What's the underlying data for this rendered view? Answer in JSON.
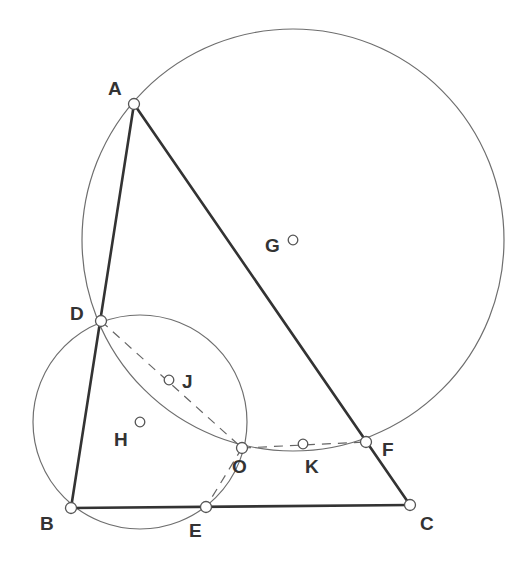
{
  "diagram": {
    "type": "geometry",
    "colors": {
      "background": "#ffffff",
      "triangle": "#333333",
      "circles": "#6e6e6e",
      "dashed": "#666666",
      "labels": "#333333"
    },
    "points": {
      "A": {
        "label": "A",
        "x": 134,
        "y": 104,
        "lx": 108,
        "ly": 95
      },
      "B": {
        "label": "B",
        "x": 71,
        "y": 508,
        "lx": 40,
        "ly": 530
      },
      "C": {
        "label": "C",
        "x": 410,
        "y": 505,
        "lx": 420,
        "ly": 530
      },
      "D": {
        "label": "D",
        "x": 101,
        "y": 321,
        "lx": 70,
        "ly": 320
      },
      "E": {
        "label": "E",
        "x": 206,
        "y": 507,
        "lx": 189,
        "ly": 537
      },
      "F": {
        "label": "F",
        "x": 366,
        "y": 442,
        "lx": 382,
        "ly": 456
      },
      "O": {
        "label": "O",
        "x": 242,
        "y": 448,
        "lx": 232,
        "ly": 473
      },
      "K": {
        "label": "K",
        "x": 303,
        "y": 444,
        "lx": 305,
        "ly": 473
      },
      "J": {
        "label": "J",
        "x": 169,
        "y": 380,
        "lx": 182,
        "ly": 388
      },
      "G": {
        "label": "G",
        "x": 293,
        "y": 240,
        "lx": 265,
        "ly": 252
      },
      "H": {
        "label": "H",
        "x": 140,
        "y": 422,
        "lx": 114,
        "ly": 446
      }
    },
    "circles": [
      {
        "name": "circle-G",
        "center": "G",
        "cx": 293,
        "cy": 240,
        "r": 211
      },
      {
        "name": "circle-H",
        "center": "H",
        "cx": 140,
        "cy": 422,
        "r": 107
      }
    ],
    "segments": [
      {
        "name": "side-AB",
        "from": "A",
        "to": "B",
        "style": "solid"
      },
      {
        "name": "side-BC",
        "from": "B",
        "to": "C",
        "style": "solid"
      },
      {
        "name": "side-AC",
        "from": "A",
        "to": "C",
        "style": "solid"
      },
      {
        "name": "segment-DO",
        "from": "D",
        "to": "O",
        "style": "dashed"
      },
      {
        "name": "segment-OF",
        "from": "O",
        "to": "F",
        "style": "dashed"
      },
      {
        "name": "segment-OE",
        "from": "O",
        "to": "E",
        "style": "dashed"
      }
    ]
  }
}
